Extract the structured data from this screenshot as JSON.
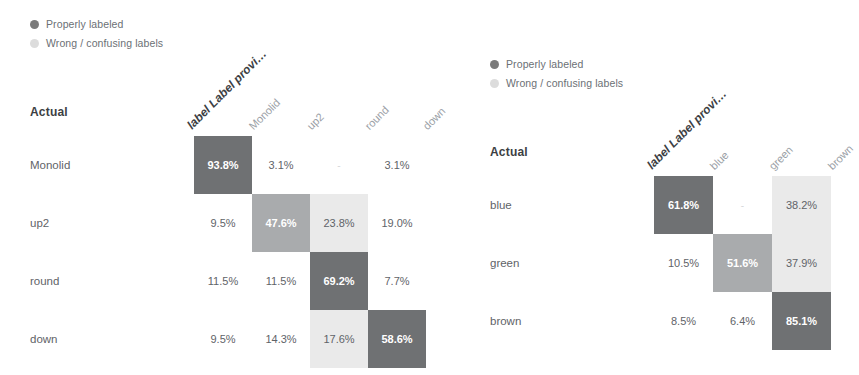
{
  "chart_data": [
    {
      "type": "heatmap",
      "name": "confusion-matrix-left",
      "title": "",
      "xlabel": "label Label provi…",
      "ylabel": "Actual",
      "legend": [
        {
          "label": "Properly labeled",
          "color": "#7b7b7b"
        },
        {
          "label": "Wrong / confusing labels",
          "color": "#dcdcdc"
        }
      ],
      "corner_label": "Actual",
      "col_header_first": "label Label provi…",
      "categories": [
        "Monolid",
        "up2",
        "round",
        "down"
      ],
      "rows": [
        "Monolid",
        "up2",
        "round",
        "down"
      ],
      "cells": [
        [
          {
            "text": "93.8%",
            "value": 93.8,
            "shade": "dark"
          },
          {
            "text": "3.1%",
            "value": 3.1,
            "shade": "none"
          },
          {
            "text": "-",
            "value": 0,
            "shade": "none"
          },
          {
            "text": "3.1%",
            "value": 3.1,
            "shade": "none"
          }
        ],
        [
          {
            "text": "9.5%",
            "value": 9.5,
            "shade": "none"
          },
          {
            "text": "47.6%",
            "value": 47.6,
            "shade": "mid"
          },
          {
            "text": "23.8%",
            "value": 23.8,
            "shade": "light"
          },
          {
            "text": "19.0%",
            "value": 19.0,
            "shade": "none"
          }
        ],
        [
          {
            "text": "11.5%",
            "value": 11.5,
            "shade": "none"
          },
          {
            "text": "11.5%",
            "value": 11.5,
            "shade": "none"
          },
          {
            "text": "69.2%",
            "value": 69.2,
            "shade": "dark"
          },
          {
            "text": "7.7%",
            "value": 7.7,
            "shade": "none"
          }
        ],
        [
          {
            "text": "9.5%",
            "value": 9.5,
            "shade": "none"
          },
          {
            "text": "14.3%",
            "value": 14.3,
            "shade": "none"
          },
          {
            "text": "17.6%",
            "value": 17.6,
            "shade": "light"
          },
          {
            "text": "58.6%",
            "value": 58.6,
            "shade": "dark"
          }
        ]
      ]
    },
    {
      "type": "heatmap",
      "name": "confusion-matrix-right",
      "title": "",
      "xlabel": "label Label provi…",
      "ylabel": "Actual",
      "legend": [
        {
          "label": "Properly labeled",
          "color": "#7b7b7b"
        },
        {
          "label": "Wrong / confusing labels",
          "color": "#dcdcdc"
        }
      ],
      "corner_label": "Actual",
      "col_header_first": "label Label provi…",
      "categories": [
        "blue",
        "green",
        "brown"
      ],
      "rows": [
        "blue",
        "green",
        "brown"
      ],
      "cells": [
        [
          {
            "text": "61.8%",
            "value": 61.8,
            "shade": "dark"
          },
          {
            "text": "-",
            "value": 0,
            "shade": "none"
          },
          {
            "text": "38.2%",
            "value": 38.2,
            "shade": "light"
          }
        ],
        [
          {
            "text": "10.5%",
            "value": 10.5,
            "shade": "none"
          },
          {
            "text": "51.6%",
            "value": 51.6,
            "shade": "mid"
          },
          {
            "text": "37.9%",
            "value": 37.9,
            "shade": "light"
          }
        ],
        [
          {
            "text": "8.5%",
            "value": 8.5,
            "shade": "none"
          },
          {
            "text": "6.4%",
            "value": 6.4,
            "shade": "none"
          },
          {
            "text": "85.1%",
            "value": 85.1,
            "shade": "dark"
          }
        ]
      ]
    }
  ],
  "style": {
    "shade_dark_bg": "#6f7173",
    "shade_dark_fg": "#ffffff",
    "shade_mid_bg": "#a9abad",
    "shade_mid_fg": "#ffffff",
    "shade_light_bg": "#eaeaea",
    "shade_light_fg": "#5f6368",
    "shade_none_bg": "#ffffff",
    "shade_none_fg": "#5f6368"
  },
  "layout": {
    "left": {
      "cell_w": 58,
      "cell_h": 58,
      "label_w": 150,
      "col_gap": 0
    },
    "right": {
      "cell_w": 59,
      "cell_h": 58,
      "label_w": 150,
      "col_gap": 0
    }
  }
}
